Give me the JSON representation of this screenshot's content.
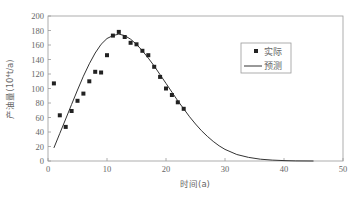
{
  "chart_data": {
    "type": "scatter+line",
    "title": "",
    "xlabel": "时间(a)",
    "ylabel": "产油量(10⁴t/a)",
    "xlim": [
      0,
      50
    ],
    "ylim": [
      0,
      200
    ],
    "x_ticks": [
      0,
      10,
      20,
      30,
      40,
      50
    ],
    "y_ticks": [
      0,
      20,
      40,
      60,
      80,
      100,
      120,
      140,
      160,
      180,
      200
    ],
    "grid": false,
    "legend_position": "upper right (inside)",
    "series": [
      {
        "name": "实际",
        "kind": "scatter",
        "marker": "square",
        "color": "#222222",
        "x": [
          1,
          2,
          3,
          4,
          5,
          6,
          7,
          8,
          9,
          10,
          11,
          12,
          13,
          14,
          15,
          16,
          17,
          18,
          19,
          20,
          21,
          22,
          23
        ],
        "y": [
          107,
          63,
          47,
          69,
          83,
          93,
          110,
          123,
          122,
          146,
          173,
          178,
          171,
          163,
          161,
          152,
          146,
          130,
          116,
          100,
          91,
          81,
          72
        ]
      },
      {
        "name": "预测",
        "kind": "line",
        "color": "#333333",
        "x": [
          1,
          2,
          3,
          4,
          5,
          6,
          7,
          8,
          9,
          10,
          11,
          12,
          13,
          14,
          15,
          16,
          17,
          18,
          19,
          20,
          21,
          22,
          23,
          24,
          25,
          26,
          27,
          28,
          29,
          30,
          32,
          34,
          36,
          38,
          40,
          42,
          45
        ],
        "y": [
          18,
          38,
          58,
          78,
          98,
          117,
          134,
          149,
          161,
          169,
          173,
          175,
          173,
          168,
          161,
          152,
          142,
          131,
          119,
          107,
          95,
          83,
          72,
          61,
          51,
          42,
          34,
          27,
          21,
          16,
          9,
          5,
          2.5,
          1.2,
          0.5,
          0.2,
          0
        ]
      }
    ]
  },
  "legend": {
    "actual_label": "实际",
    "predicted_label": "预测"
  },
  "axes": {
    "x_title": "时间(a)",
    "y_title": "产油量(10⁴t/a)"
  }
}
